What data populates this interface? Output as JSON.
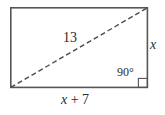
{
  "figure": {
    "type": "geometry-diagram",
    "shape": "rectangle-with-diagonal",
    "canvas": {
      "width": 165,
      "height": 115,
      "background": "#ffffff"
    },
    "colors": {
      "outline": "#565656",
      "diagonal": "#4a4a4a",
      "text": "#2b2b2b",
      "right_angle_marker": "#565656"
    },
    "rectangle": {
      "left": 10,
      "top": 7,
      "right": 148,
      "bottom": 88,
      "width": 138,
      "height": 81,
      "stroke_width": 1.6
    },
    "diagonal": {
      "from": {
        "x": 10,
        "y": 88
      },
      "to": {
        "x": 148,
        "y": 7
      },
      "style": "dashed",
      "dash": "5 3",
      "stroke_width": 1.4
    },
    "right_angle_marker": {
      "x": 139,
      "y": 79,
      "size": 9,
      "corner": "bottom-right"
    },
    "labels": {
      "hypotenuse": "13",
      "vertical_side": "x",
      "angle": "90°",
      "base_var": "x",
      "base_rest": " + 7",
      "base_full": "x + 7"
    }
  }
}
